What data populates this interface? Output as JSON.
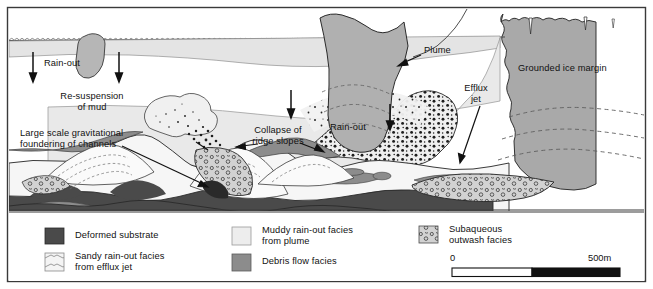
{
  "figure": {
    "background_color": "#ffffff",
    "border_color": "#000000"
  },
  "colors": {
    "ice_margin": "#a9a9a9",
    "ice_margin_light": "#b8b8b8",
    "water": "#ffffff",
    "plume_light": "#e9e9e9",
    "plume_mid": "#dedede",
    "muddy_rainout": "#ededed",
    "debris_flow": "#8c8c8c",
    "deformed_substrate": "#4a4a4a",
    "sandy_rainout": "#f2f2f2",
    "subaqueous_outwash": "#d2d2d2",
    "line": "#1a1a1a",
    "dashed": "#6b6b6b",
    "scale_fill_dark": "#111111"
  },
  "diagram_labels": [
    {
      "id": "rain-out-left",
      "text": "Rain-out",
      "x": 44,
      "y": 64,
      "align": "left"
    },
    {
      "id": "re-suspension",
      "text": "Re-suspension\nof mud",
      "x": 87,
      "y": 97,
      "align": "center"
    },
    {
      "id": "large-scale",
      "text": "Large scale gravitational\nfoundering of channels",
      "x": 22,
      "y": 133,
      "align": "left"
    },
    {
      "id": "collapse-ridge",
      "text": "Collapse of\nridge slopes",
      "x": 266,
      "y": 130,
      "align": "center"
    },
    {
      "id": "rain-out-mid",
      "text": "Rain-out",
      "x": 329,
      "y": 127,
      "align": "left"
    },
    {
      "id": "plume",
      "text": "Plume",
      "x": 424,
      "y": 50,
      "align": "left"
    },
    {
      "id": "efflux-jet",
      "text": "Efflux\njet",
      "x": 475,
      "y": 88,
      "align": "center"
    },
    {
      "id": "grounded-ice-margin",
      "text": "Grounded ice margin",
      "x": 518,
      "y": 68,
      "align": "left"
    }
  ],
  "legend": {
    "items": [
      {
        "id": "deformed-substrate",
        "label": "Deformed substrate",
        "swatch": "deformed-substrate",
        "col": 0,
        "row": 0
      },
      {
        "id": "sandy-rainout",
        "label": "Sandy rain-out facies\nfrom efflux jet",
        "swatch": "sandy-rainout",
        "col": 0,
        "row": 1
      },
      {
        "id": "muddy-rainout",
        "label": "Muddy rain-out facies\nfrom plume",
        "swatch": "muddy-rainout",
        "col": 1,
        "row": 0
      },
      {
        "id": "debris-flow",
        "label": "Debris flow facies",
        "swatch": "debris-flow",
        "col": 1,
        "row": 1
      },
      {
        "id": "subaqueous-outwash",
        "label": "Subaqueous\noutwash facies",
        "swatch": "subaqueous-outwash",
        "col": 2,
        "row": 0
      }
    ]
  },
  "scale_bar": {
    "min_label": "0",
    "max_label": "500m",
    "segments": 2,
    "total_distance_m": 500
  }
}
